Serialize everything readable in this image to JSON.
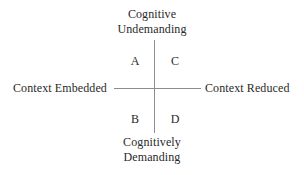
{
  "diagram": {
    "type": "quadrant-matrix",
    "background_color": "#ffffff",
    "text_color": "#2a2a2a",
    "axis_color": "#8d8d8d",
    "axes": {
      "vertical": {
        "top_pole_line1": "Cognitive",
        "top_pole_line2": "Undemanding",
        "bottom_pole_line1": "Cognitively",
        "bottom_pole_line2": "Demanding"
      },
      "horizontal": {
        "left_pole": "Context Embedded",
        "right_pole": "Context Reduced"
      }
    },
    "quadrants": [
      {
        "id": "A",
        "label": "A",
        "position": "top-left"
      },
      {
        "id": "C",
        "label": "C",
        "position": "top-right"
      },
      {
        "id": "B",
        "label": "B",
        "position": "bottom-left"
      },
      {
        "id": "D",
        "label": "D",
        "position": "bottom-right"
      }
    ]
  }
}
